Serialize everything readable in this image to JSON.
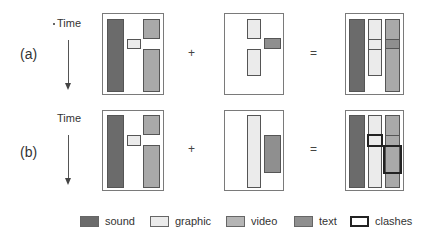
{
  "rows": [
    {
      "label": "(a)",
      "time_label": "Time",
      "plus": "+",
      "equals": "="
    },
    {
      "label": "(b)",
      "time_label": "Time",
      "plus": "+",
      "equals": "="
    }
  ],
  "legend": [
    {
      "key": "sound",
      "label": "sound",
      "color": "#6b6b6b"
    },
    {
      "key": "graphic",
      "label": "graphic",
      "color": "#ebebeb"
    },
    {
      "key": "video",
      "label": "video",
      "color": "#a9a9a9"
    },
    {
      "key": "text",
      "label": "text",
      "color": "#8f8f8f"
    },
    {
      "key": "clashes",
      "label": "clashes",
      "color": "#222222"
    }
  ],
  "panels": {
    "a_left": [
      "sound",
      "graphic",
      "video",
      "video"
    ],
    "a_middle": [
      "graphic",
      "text",
      "graphic"
    ],
    "a_result": [
      "sound",
      "graphic",
      "video/text"
    ],
    "b_left": [
      "sound",
      "graphic",
      "video",
      "video"
    ],
    "b_middle": [
      "graphic",
      "text"
    ],
    "b_result": [
      "sound",
      "graphic",
      "video",
      "clash",
      "clash"
    ]
  }
}
